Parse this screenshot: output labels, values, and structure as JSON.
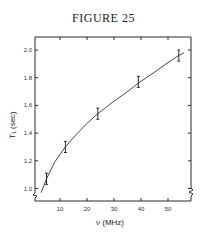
{
  "figure": {
    "title": "FIGURE 25"
  },
  "chart_data": {
    "type": "line",
    "title": "FIGURE 25",
    "xlabel": "ν (MHz)",
    "ylabel": "T₁ (sec)",
    "xlim": [
      0,
      58
    ],
    "ylim": [
      0.92,
      2.09
    ],
    "x_ticks": [
      10,
      20,
      30,
      40,
      50
    ],
    "y_ticks": [
      1.0,
      1.2,
      1.4,
      1.6,
      1.8,
      2.0
    ],
    "x_tick_labels": [
      "10",
      "20",
      "30",
      "40",
      "50"
    ],
    "y_tick_labels": [
      "1.0",
      "1.2",
      "1.4",
      "1.6",
      "1.8",
      "2.0"
    ],
    "grid": false,
    "axis_breaks": [
      "y-axis bottom-left",
      "right axis bottom"
    ],
    "series": [
      {
        "name": "measured T1",
        "style": "points with error bars",
        "x": [
          5,
          12,
          24,
          39,
          54
        ],
        "y": [
          1.07,
          1.3,
          1.54,
          1.77,
          1.96
        ],
        "yerr": [
          0.04,
          0.04,
          0.04,
          0.04,
          0.04
        ]
      },
      {
        "name": "fit curve",
        "style": "smooth line",
        "x": [
          3,
          5,
          8,
          12,
          16,
          20,
          24,
          30,
          35,
          39,
          45,
          50,
          54,
          56
        ],
        "y": [
          0.97,
          1.07,
          1.19,
          1.3,
          1.39,
          1.47,
          1.54,
          1.63,
          1.7,
          1.76,
          1.84,
          1.91,
          1.96,
          1.98
        ]
      }
    ]
  }
}
